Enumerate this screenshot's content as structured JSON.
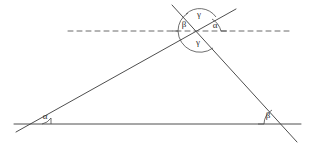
{
  "figure": {
    "background_color": "#ffffff",
    "line_color": "#3a3a3a",
    "dashed_line_color": "#5a5a5a",
    "arc_color": "#4a4a4a",
    "label_color": "#2b2b2b",
    "stroke_width": 0.9,
    "width": 311,
    "height": 146
  },
  "vertices": {
    "left": {
      "name": "left-vertex",
      "x": 28,
      "y": 124
    },
    "right": {
      "name": "right-vertex",
      "x": 281,
      "y": 124
    },
    "apex": {
      "name": "apex-vertex",
      "x": 200,
      "y": 31
    }
  },
  "segments": {
    "baseline": {
      "name": "baseline",
      "x1": 14,
      "y1": 124,
      "x2": 301,
      "y2": 124,
      "style": "solid"
    },
    "left_side": {
      "name": "left-side-transversal",
      "x1": 16,
      "y1": 132,
      "x2": 236,
      "y2": 9,
      "style": "solid"
    },
    "right_side": {
      "name": "right-side-transversal",
      "x1": 172,
      "y1": 5,
      "x2": 297,
      "y2": 142,
      "style": "solid"
    },
    "parallel_dashed": {
      "name": "parallel-dashed-line",
      "x1": 68,
      "y1": 31,
      "x2": 291,
      "y2": 31,
      "style": "dashed",
      "dash_pattern": "5,4"
    }
  },
  "labels": [
    {
      "id": "alpha-base",
      "name": "angle-label-alpha-base",
      "text": "α",
      "x": 45,
      "y": 117
    },
    {
      "id": "beta-base",
      "name": "angle-label-beta-base",
      "text": "β",
      "x": 268,
      "y": 116
    },
    {
      "id": "beta-apex",
      "name": "angle-label-beta-apex",
      "text": "β",
      "x": 184,
      "y": 25
    },
    {
      "id": "gamma-upper",
      "name": "angle-label-gamma-upper",
      "text": "γ",
      "x": 199,
      "y": 15
    },
    {
      "id": "alpha-apex",
      "name": "angle-label-alpha-apex",
      "text": "α",
      "x": 215,
      "y": 26
    },
    {
      "id": "gamma-lower",
      "name": "angle-label-gamma-lower",
      "text": "γ",
      "x": 198,
      "y": 43
    }
  ],
  "arcs": [
    {
      "id": "arc-alpha-base",
      "name": "angle-arc-alpha-base",
      "d": "M 42 124 A 14 14 0 0 0 51 118"
    },
    {
      "id": "arc-beta-base",
      "name": "angle-arc-beta-base",
      "d": "M 264 124 A 17 17 0 0 1 272 110"
    },
    {
      "id": "arc-beta-apex",
      "name": "angle-arc-beta-apex",
      "d": "M 178 31 A 22 22 0 0 1 188 13"
    },
    {
      "id": "arc-gamma-upper",
      "name": "angle-arc-gamma-upper",
      "d": "M 186 14 A 20 20 0 0 1 216 17"
    },
    {
      "id": "arc-alpha-apex",
      "name": "angle-arc-alpha-apex",
      "d": "M 212 19 A 20 20 0 0 1 221 31"
    },
    {
      "id": "arc-gamma-lower",
      "name": "angle-arc-gamma-lower",
      "d": "M 178 31 A 22 22 0 0 0 213 48"
    }
  ],
  "tick_marks": [
    {
      "id": "tick-alpha-base",
      "name": "angle-tick-alpha-base",
      "x1": 51,
      "y1": 118,
      "x2": 51,
      "y2": 124
    },
    {
      "id": "tick-beta-base",
      "name": "angle-tick-beta-base",
      "x1": 264,
      "y1": 124,
      "x2": 258,
      "y2": 124
    },
    {
      "id": "tick-beta-apex",
      "name": "angle-tick-beta-apex",
      "x1": 178,
      "y1": 31,
      "x2": 172,
      "y2": 31
    },
    {
      "id": "tick-alpha-apex",
      "name": "angle-tick-alpha-apex",
      "x1": 221,
      "y1": 31,
      "x2": 227,
      "y2": 31
    }
  ]
}
